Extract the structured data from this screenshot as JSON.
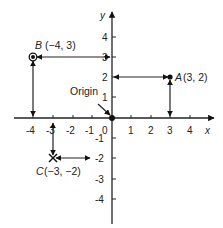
{
  "diagram": {
    "type": "coordinate-plane",
    "axes": {
      "x_label": "x",
      "y_label": "y",
      "origin_label": "Origin",
      "origin_value": "0"
    },
    "x_ticks": [
      "-4",
      "-3",
      "-2",
      "-1",
      "1",
      "2",
      "3",
      "4"
    ],
    "y_ticks": [
      "4",
      "3",
      "2",
      "1",
      "-1",
      "-2",
      "-3",
      "-4"
    ],
    "points": [
      {
        "name": "A",
        "coords": "(3, 2)",
        "x": 3,
        "y": 2,
        "marker": "dot"
      },
      {
        "name": "B",
        "coords": "(−4, 3)",
        "x": -4,
        "y": 3,
        "marker": "circled-dot"
      },
      {
        "name": "C",
        "coords": "(−3, −2)",
        "x": -3,
        "y": -2,
        "marker": "cross"
      }
    ]
  }
}
